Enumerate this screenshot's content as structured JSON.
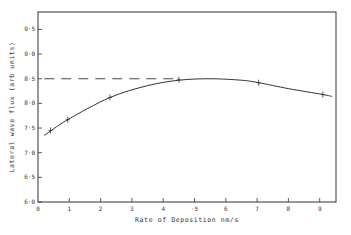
{
  "chart_data": {
    "type": "line",
    "title": "",
    "xlabel": "Rate of Deposition nm/s",
    "ylabel": "Lateral wave flux (arb units)",
    "xlim": [
      0,
      9.5
    ],
    "ylim": [
      6.0,
      9.75
    ],
    "x_ticks": [
      0,
      1,
      2,
      3,
      4,
      5,
      6,
      7,
      8,
      9
    ],
    "x_tick_labels": [
      "0",
      "1",
      "2",
      "3",
      "4",
      "·5",
      "6",
      "7",
      "8",
      "9"
    ],
    "y_ticks": [
      6.0,
      6.5,
      7.0,
      7.5,
      8.0,
      8.5,
      9.0,
      9.5
    ],
    "y_tick_labels": [
      "6·0",
      "6·5",
      "7·0",
      "7·5",
      "8·0",
      "8·5",
      "9·0",
      "9·5"
    ],
    "grid": false,
    "legend": null,
    "series": [
      {
        "name": "measured",
        "style": "points-with-error-bars",
        "x": [
          0.4,
          0.95,
          2.3,
          4.5,
          7.05,
          9.1
        ],
        "y": [
          7.45,
          7.67,
          8.12,
          8.48,
          8.42,
          8.18
        ]
      },
      {
        "name": "fitted curve",
        "style": "solid",
        "x": [
          0.2,
          0.95,
          2.3,
          3.5,
          4.5,
          5.5,
          6.5,
          7.05,
          8.0,
          9.1,
          9.4
        ],
        "y": [
          7.35,
          7.67,
          8.12,
          8.36,
          8.47,
          8.5,
          8.47,
          8.42,
          8.3,
          8.18,
          8.14
        ]
      },
      {
        "name": "reference level",
        "style": "dashed",
        "x": [
          0.2,
          4.5
        ],
        "y": [
          8.5,
          8.5
        ]
      }
    ]
  }
}
